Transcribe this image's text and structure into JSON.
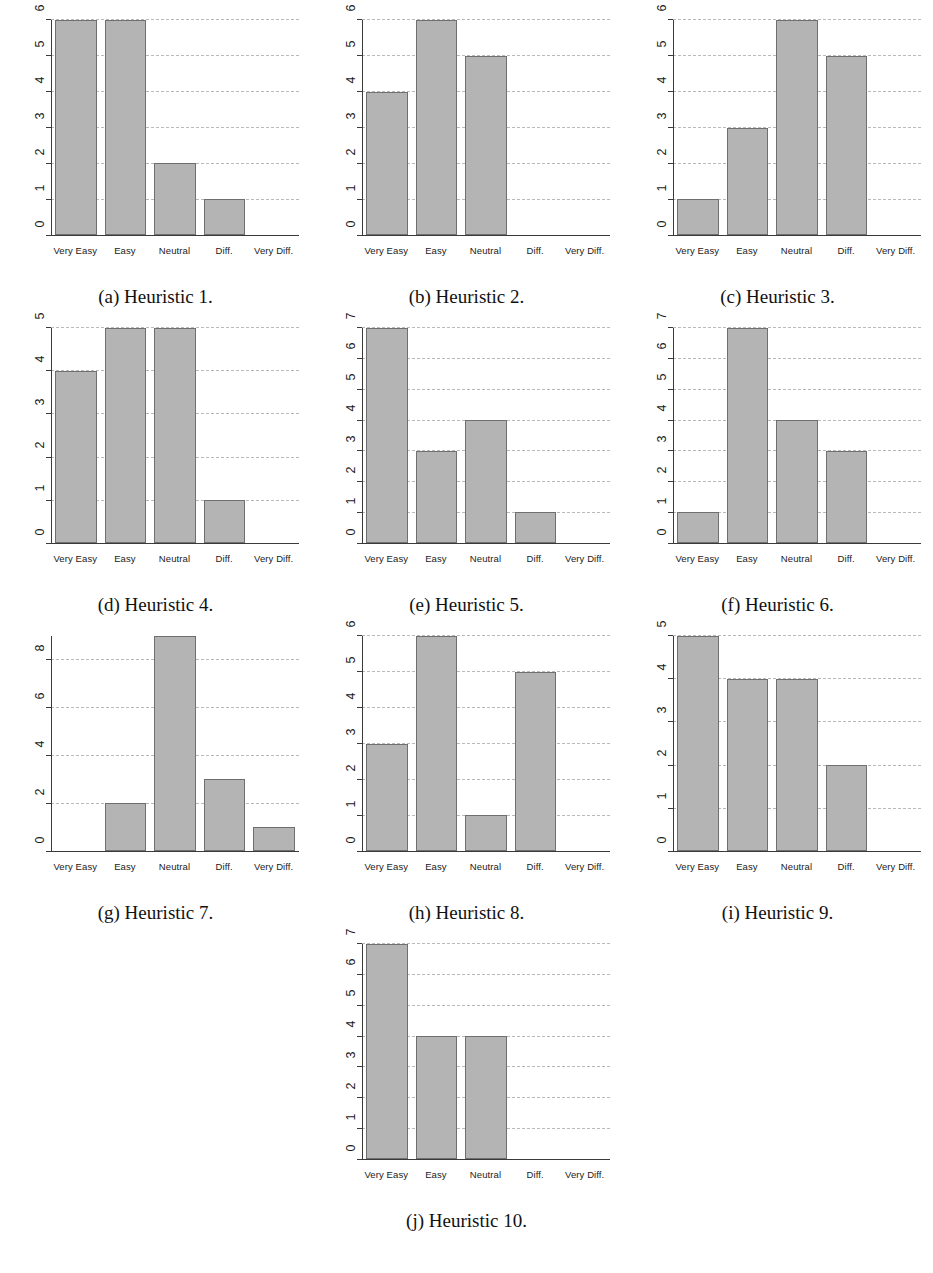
{
  "figure": {
    "categories": [
      "Very Easy",
      "Easy",
      "Neutral",
      "Diff.",
      "Very Diff."
    ],
    "bar_fill_color": "#b4b4b4",
    "bar_edge_color": "#6f6f6f",
    "gridline_color": "#b9b9b9",
    "axis_color": "#3a3a3a"
  },
  "chart_data": [
    {
      "type": "bar",
      "id": "heuristic-1",
      "title": "(a) Heuristic 1.",
      "caption": "(a) Heuristic 1.",
      "categories": [
        "Very Easy",
        "Easy",
        "Neutral",
        "Diff.",
        "Very Diff."
      ],
      "values": [
        6,
        6,
        2,
        1,
        0
      ],
      "xlabel": "",
      "ylabel": "",
      "ylim": [
        0,
        6
      ],
      "yticks": [
        0,
        1,
        2,
        3,
        4,
        5,
        6
      ],
      "grid": true,
      "legend": "none"
    },
    {
      "type": "bar",
      "id": "heuristic-2",
      "title": "(b) Heuristic 2.",
      "caption": "(b) Heuristic 2.",
      "categories": [
        "Very Easy",
        "Easy",
        "Neutral",
        "Diff.",
        "Very Diff."
      ],
      "values": [
        4,
        6,
        5,
        0,
        0
      ],
      "xlabel": "",
      "ylabel": "",
      "ylim": [
        0,
        6
      ],
      "yticks": [
        0,
        1,
        2,
        3,
        4,
        5,
        6
      ],
      "grid": true,
      "legend": "none"
    },
    {
      "type": "bar",
      "id": "heuristic-3",
      "title": "(c) Heuristic 3.",
      "caption": "(c) Heuristic 3.",
      "categories": [
        "Very Easy",
        "Easy",
        "Neutral",
        "Diff.",
        "Very Diff."
      ],
      "values": [
        1,
        3,
        6,
        5,
        0
      ],
      "xlabel": "",
      "ylabel": "",
      "ylim": [
        0,
        6
      ],
      "yticks": [
        0,
        1,
        2,
        3,
        4,
        5,
        6
      ],
      "grid": true,
      "legend": "none"
    },
    {
      "type": "bar",
      "id": "heuristic-4",
      "title": "(d) Heuristic 4.",
      "caption": "(d) Heuristic 4.",
      "categories": [
        "Very Easy",
        "Easy",
        "Neutral",
        "Diff.",
        "Very Diff."
      ],
      "values": [
        4,
        5,
        5,
        1,
        0
      ],
      "xlabel": "",
      "ylabel": "",
      "ylim": [
        0,
        5
      ],
      "yticks": [
        0,
        1,
        2,
        3,
        4,
        5
      ],
      "grid": true,
      "legend": "none"
    },
    {
      "type": "bar",
      "id": "heuristic-5",
      "title": "(e) Heuristic 5.",
      "caption": "(e) Heuristic 5.",
      "categories": [
        "Very Easy",
        "Easy",
        "Neutral",
        "Diff.",
        "Very Diff."
      ],
      "values": [
        7,
        3,
        4,
        1,
        0
      ],
      "xlabel": "",
      "ylabel": "",
      "ylim": [
        0,
        7
      ],
      "yticks": [
        0,
        1,
        2,
        3,
        4,
        5,
        6,
        7
      ],
      "grid": true,
      "legend": "none"
    },
    {
      "type": "bar",
      "id": "heuristic-6",
      "title": "(f) Heuristic 6.",
      "caption": "(f) Heuristic 6.",
      "categories": [
        "Very Easy",
        "Easy",
        "Neutral",
        "Diff.",
        "Very Diff."
      ],
      "values": [
        1,
        7,
        4,
        3,
        0
      ],
      "xlabel": "",
      "ylabel": "",
      "ylim": [
        0,
        7
      ],
      "yticks": [
        0,
        1,
        2,
        3,
        4,
        5,
        6,
        7
      ],
      "grid": true,
      "legend": "none"
    },
    {
      "type": "bar",
      "id": "heuristic-7",
      "title": "(g) Heuristic 7.",
      "caption": "(g) Heuristic 7.",
      "categories": [
        "Very Easy",
        "Easy",
        "Neutral",
        "Diff.",
        "Very Diff."
      ],
      "values": [
        0,
        2,
        9,
        3,
        1
      ],
      "xlabel": "",
      "ylabel": "",
      "ylim": [
        0,
        9
      ],
      "yticks": [
        0,
        2,
        4,
        6,
        8
      ],
      "grid": true,
      "legend": "none"
    },
    {
      "type": "bar",
      "id": "heuristic-8",
      "title": "(h) Heuristic 8.",
      "caption": "(h) Heuristic 8.",
      "categories": [
        "Very Easy",
        "Easy",
        "Neutral",
        "Diff.",
        "Very Diff."
      ],
      "values": [
        3,
        6,
        1,
        5,
        0
      ],
      "xlabel": "",
      "ylabel": "",
      "ylim": [
        0,
        6
      ],
      "yticks": [
        0,
        1,
        2,
        3,
        4,
        5,
        6
      ],
      "grid": true,
      "legend": "none"
    },
    {
      "type": "bar",
      "id": "heuristic-9",
      "title": "(i) Heuristic 9.",
      "caption": "(i) Heuristic 9.",
      "categories": [
        "Very Easy",
        "Easy",
        "Neutral",
        "Diff.",
        "Very Diff."
      ],
      "values": [
        5,
        4,
        4,
        2,
        0
      ],
      "xlabel": "",
      "ylabel": "",
      "ylim": [
        0,
        5
      ],
      "yticks": [
        0,
        1,
        2,
        3,
        4,
        5
      ],
      "grid": true,
      "legend": "none"
    },
    {
      "type": "bar",
      "id": "heuristic-10",
      "title": "(j) Heuristic 10.",
      "caption": "(j) Heuristic 10.",
      "categories": [
        "Very Easy",
        "Easy",
        "Neutral",
        "Diff.",
        "Very Diff."
      ],
      "values": [
        7,
        4,
        4,
        0,
        0
      ],
      "xlabel": "",
      "ylabel": "",
      "ylim": [
        0,
        7
      ],
      "yticks": [
        0,
        1,
        2,
        3,
        4,
        5,
        6,
        7
      ],
      "grid": true,
      "legend": "none"
    }
  ]
}
